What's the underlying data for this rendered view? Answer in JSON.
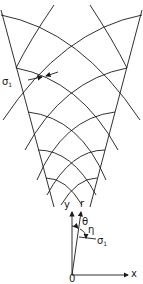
{
  "diagram": {
    "title": "",
    "labels": {
      "sigma_left": "σ",
      "sigma_left_sub": "1",
      "y_axis": "y",
      "r_axis": "r",
      "theta": "θ",
      "eta": "η",
      "sigma_axis": "σ",
      "sigma_axis_sub": "1",
      "x_axis": "x",
      "origin": "0"
    },
    "colors": {
      "stroke": "#1a1a1a",
      "background": "#ffffff"
    }
  }
}
